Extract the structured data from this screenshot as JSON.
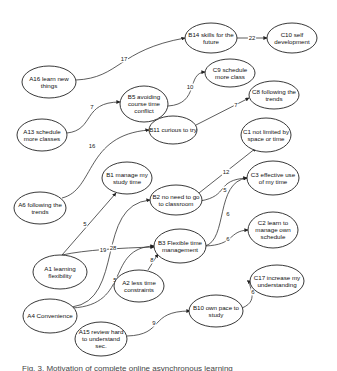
{
  "diagram": {
    "type": "directed-graph",
    "nodes": [
      {
        "id": "B14",
        "lines": [
          "B14 skills for the",
          "future"
        ],
        "cx": 211,
        "cy": 38,
        "rx": 26,
        "ry": 15
      },
      {
        "id": "C10",
        "lines": [
          "C10 self",
          "development"
        ],
        "cx": 292,
        "cy": 38,
        "rx": 25,
        "ry": 15
      },
      {
        "id": "A16",
        "lines": [
          "A16 learn new",
          "things"
        ],
        "cx": 49,
        "cy": 82,
        "rx": 27,
        "ry": 16
      },
      {
        "id": "C9",
        "lines": [
          "C9 schedule",
          "more class"
        ],
        "cx": 230,
        "cy": 73,
        "rx": 25,
        "ry": 14
      },
      {
        "id": "B5",
        "lines": [
          "B5 avoiding",
          "course time",
          "conflict"
        ],
        "cx": 144,
        "cy": 104,
        "rx": 24,
        "ry": 18
      },
      {
        "id": "C8",
        "lines": [
          "C8 following the",
          "trends"
        ],
        "cx": 274,
        "cy": 95,
        "rx": 25,
        "ry": 14
      },
      {
        "id": "A13",
        "lines": [
          "A13 schedule",
          "more classes"
        ],
        "cx": 42,
        "cy": 135,
        "rx": 25,
        "ry": 16
      },
      {
        "id": "B11",
        "lines": [
          "B11 curious to try"
        ],
        "cx": 173,
        "cy": 130,
        "rx": 24,
        "ry": 14
      },
      {
        "id": "C1",
        "lines": [
          "C1 not limited by",
          "space or time"
        ],
        "cx": 266,
        "cy": 135,
        "rx": 25,
        "ry": 17
      },
      {
        "id": "A6",
        "lines": [
          "A6 following the",
          "trends"
        ],
        "cx": 40,
        "cy": 208,
        "rx": 26,
        "ry": 16
      },
      {
        "id": "B1",
        "lines": [
          "B1 manage my",
          "study time"
        ],
        "cx": 127,
        "cy": 178,
        "rx": 25,
        "ry": 16
      },
      {
        "id": "B2",
        "lines": [
          "B2 no need to go",
          "to classroom"
        ],
        "cx": 176,
        "cy": 200,
        "rx": 26,
        "ry": 15
      },
      {
        "id": "C3",
        "lines": [
          "C3 effective use",
          "of my time"
        ],
        "cx": 273,
        "cy": 178,
        "rx": 26,
        "ry": 17
      },
      {
        "id": "B3",
        "lines": [
          "B3 Flexible time",
          "management"
        ],
        "cx": 180,
        "cy": 246,
        "rx": 26,
        "ry": 17
      },
      {
        "id": "C2",
        "lines": [
          "C2 learn to",
          "manage own",
          "schedule"
        ],
        "cx": 273,
        "cy": 230,
        "rx": 25,
        "ry": 18
      },
      {
        "id": "A1",
        "lines": [
          "A1 learning",
          "flexibility"
        ],
        "cx": 60,
        "cy": 272,
        "rx": 27,
        "ry": 17
      },
      {
        "id": "A2",
        "lines": [
          "A2 less time",
          "constraints"
        ],
        "cx": 139,
        "cy": 286,
        "rx": 25,
        "ry": 16
      },
      {
        "id": "C17",
        "lines": [
          "C17 increase my",
          "understanding"
        ],
        "cx": 277,
        "cy": 281,
        "rx": 27,
        "ry": 16
      },
      {
        "id": "A4",
        "lines": [
          "A4 Convenience"
        ],
        "cx": 50,
        "cy": 316,
        "rx": 27,
        "ry": 17
      },
      {
        "id": "B10",
        "lines": [
          "B10 own pace to",
          "study"
        ],
        "cx": 216,
        "cy": 311,
        "rx": 27,
        "ry": 16
      },
      {
        "id": "A15",
        "lines": [
          "A15 review hard",
          "to understand",
          "sec."
        ],
        "cx": 101,
        "cy": 339,
        "rx": 26,
        "ry": 17
      }
    ],
    "edges": [
      {
        "from": "A16",
        "to": "B14",
        "weight": "17",
        "d": "M76,80 C120,78 118,50 185,38",
        "lx": 124,
        "ly": 59
      },
      {
        "from": "B14",
        "to": "C10",
        "weight": "22",
        "d": "M237,38 L267,38",
        "lx": 252,
        "ly": 38
      },
      {
        "from": "A13",
        "to": "B5",
        "weight": "7",
        "d": "M67,133 C95,130 82,102 120,102",
        "lx": 92,
        "ly": 107
      },
      {
        "from": "B5",
        "to": "C9",
        "weight": "10",
        "d": "M168,106 C200,104 186,73 205,72",
        "lx": 190,
        "ly": 87
      },
      {
        "from": "A6",
        "to": "B11",
        "weight": "16",
        "d": "M62,198 C95,190 85,135 149,130",
        "lx": 92,
        "ly": 146
      },
      {
        "from": "B11",
        "to": "C8",
        "weight": "7",
        "d": "M196,125 L249,98",
        "lx": 236,
        "ly": 105
      },
      {
        "from": "A1",
        "to": "B1",
        "weight": "5",
        "d": "M62,255 L116,193",
        "lx": 85,
        "ly": 224
      },
      {
        "from": "A1",
        "to": "B3",
        "weight": "19",
        "d": "M62,255 C85,250 120,248 154,247",
        "lx": 103,
        "ly": 250
      },
      {
        "from": "A4",
        "to": "B2",
        "weight": "28",
        "d": "M72,307 C125,300 95,205 150,200",
        "lx": 113,
        "ly": 248
      },
      {
        "from": "A4",
        "to": "B3",
        "weight": "5",
        "d": "M72,308 C132,305 105,248 154,246",
        "lx": 115,
        "ly": 280
      },
      {
        "from": "A2",
        "to": "B3",
        "weight": "8",
        "d": "M148,270 L158,254",
        "lx": 152,
        "ly": 260
      },
      {
        "from": "B2",
        "to": "C1",
        "weight": "12",
        "d": "M199,193 L256,148",
        "lx": 226,
        "ly": 172
      },
      {
        "from": "B2",
        "to": "C3",
        "weight": "5",
        "d": "M200,201 C230,196 215,180 247,178",
        "lx": 225,
        "ly": 190
      },
      {
        "from": "B3",
        "to": "C3",
        "weight": "6",
        "d": "M205,246 C228,240 215,182 247,178",
        "lx": 228,
        "ly": 214
      },
      {
        "from": "B3",
        "to": "C2",
        "weight": "6",
        "d": "M205,246 C235,245 228,231 248,230",
        "lx": 228,
        "ly": 239
      },
      {
        "from": "B10",
        "to": "C17",
        "weight": "6",
        "d": "M242,308 C262,300 245,283 251,281",
        "lx": 253,
        "ly": 292
      },
      {
        "from": "A15",
        "to": "B10",
        "weight": "9",
        "d": "M127,336 C165,335 148,311 190,311",
        "lx": 154,
        "ly": 323
      }
    ]
  },
  "caption": {
    "text": "Fig. 3. Motivation of complete online asynchronous learning"
  }
}
